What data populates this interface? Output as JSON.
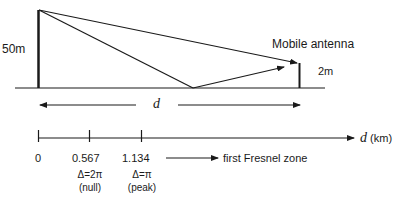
{
  "diagram": {
    "base_station_height": "50m",
    "mobile_label": "Mobile antenna",
    "mobile_height": "2m",
    "distance_symbol": "d",
    "axis": {
      "label_symbol": "d",
      "label_unit": "(km)",
      "ticks": [
        {
          "value": "0"
        },
        {
          "value": "0.567",
          "phase": "Δ=2π",
          "note": "(null)"
        },
        {
          "value": "1.134",
          "phase": "Δ=π",
          "note": "(peak)"
        }
      ],
      "zone_label": "first Fresnel zone"
    },
    "colors": {
      "line": "#1a1a1a",
      "background": "#ffffff"
    }
  }
}
